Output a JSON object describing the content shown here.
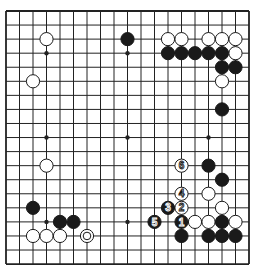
{
  "board": {
    "size": 19,
    "origin": {
      "x": 6,
      "y": 11
    },
    "spacing": {
      "x": 13.5,
      "y": 14.06
    },
    "colors": {
      "line": "#222222",
      "black": "#1a1a1a",
      "white": "#ffffff",
      "background": "#ffffff"
    },
    "star_points": [
      [
        3,
        3
      ],
      [
        9,
        3
      ],
      [
        15,
        3
      ],
      [
        3,
        9
      ],
      [
        9,
        9
      ],
      [
        15,
        9
      ],
      [
        3,
        15
      ],
      [
        9,
        15
      ],
      [
        15,
        15
      ]
    ],
    "stones": [
      {
        "col": 3,
        "row": 2,
        "color": "white"
      },
      {
        "col": 2,
        "row": 5,
        "color": "white"
      },
      {
        "col": 9,
        "row": 2,
        "color": "black"
      },
      {
        "col": 12,
        "row": 2,
        "color": "white"
      },
      {
        "col": 13,
        "row": 2,
        "color": "white"
      },
      {
        "col": 15,
        "row": 2,
        "color": "white"
      },
      {
        "col": 16,
        "row": 2,
        "color": "white"
      },
      {
        "col": 17,
        "row": 2,
        "color": "white"
      },
      {
        "col": 12,
        "row": 3,
        "color": "black"
      },
      {
        "col": 13,
        "row": 3,
        "color": "black"
      },
      {
        "col": 14,
        "row": 3,
        "color": "black"
      },
      {
        "col": 15,
        "row": 3,
        "color": "black"
      },
      {
        "col": 16,
        "row": 3,
        "color": "black"
      },
      {
        "col": 17,
        "row": 3,
        "color": "white"
      },
      {
        "col": 16,
        "row": 4,
        "color": "black"
      },
      {
        "col": 17,
        "row": 4,
        "color": "black"
      },
      {
        "col": 16,
        "row": 5,
        "color": "white"
      },
      {
        "col": 16,
        "row": 7,
        "color": "black"
      },
      {
        "col": 3,
        "row": 11,
        "color": "white"
      },
      {
        "col": 15,
        "row": 11,
        "color": "black"
      },
      {
        "col": 16,
        "row": 12,
        "color": "black"
      },
      {
        "col": 15,
        "row": 13,
        "color": "white"
      },
      {
        "col": 16,
        "row": 14,
        "color": "white"
      },
      {
        "col": 2,
        "row": 14,
        "color": "black"
      },
      {
        "col": 4,
        "row": 15,
        "color": "black"
      },
      {
        "col": 5,
        "row": 15,
        "color": "black"
      },
      {
        "col": 14,
        "row": 15,
        "color": "white"
      },
      {
        "col": 15,
        "row": 15,
        "color": "white"
      },
      {
        "col": 16,
        "row": 15,
        "color": "black"
      },
      {
        "col": 17,
        "row": 15,
        "color": "white"
      },
      {
        "col": 2,
        "row": 16,
        "color": "white"
      },
      {
        "col": 3,
        "row": 16,
        "color": "white"
      },
      {
        "col": 4,
        "row": 16,
        "color": "white"
      },
      {
        "col": 6,
        "row": 16,
        "color": "white",
        "marker": "circle"
      },
      {
        "col": 13,
        "row": 16,
        "color": "black"
      },
      {
        "col": 15,
        "row": 16,
        "color": "black"
      },
      {
        "col": 16,
        "row": 16,
        "color": "black"
      },
      {
        "col": 17,
        "row": 16,
        "color": "black"
      }
    ],
    "moves": [
      {
        "number": "1",
        "col": 13,
        "row": 15,
        "color": "black"
      },
      {
        "number": "2",
        "col": 13,
        "row": 14,
        "color": "white"
      },
      {
        "number": "3",
        "col": 12,
        "row": 14,
        "color": "black"
      },
      {
        "number": "4",
        "col": 13,
        "row": 13,
        "color": "white"
      },
      {
        "number": "5",
        "col": 11,
        "row": 15,
        "color": "black"
      },
      {
        "number": "6",
        "col": 13,
        "row": 11,
        "color": "white"
      }
    ]
  }
}
